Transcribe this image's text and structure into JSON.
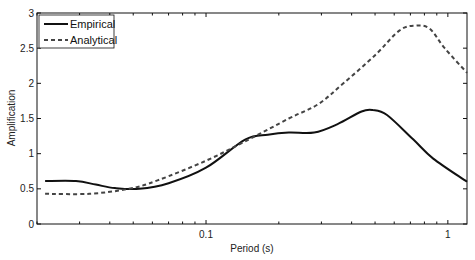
{
  "chart_data": {
    "type": "line",
    "title": "",
    "xlabel": "Period (s)",
    "ylabel": "Amplification",
    "xscale": "log",
    "xlim": [
      0.02,
      1.2
    ],
    "ylim": [
      0,
      3
    ],
    "grid": false,
    "legend_position": "upper left",
    "x_ticks": [
      {
        "value": 0.1,
        "label": "0.1"
      },
      {
        "value": 1,
        "label": "1"
      }
    ],
    "y_ticks": [
      {
        "value": 0,
        "label": "0"
      },
      {
        "value": 0.5,
        "label": "0.5"
      },
      {
        "value": 1,
        "label": "1"
      },
      {
        "value": 1.5,
        "label": "1.5"
      },
      {
        "value": 2,
        "label": "2"
      },
      {
        "value": 2.5,
        "label": "2.5"
      },
      {
        "value": 3,
        "label": "3"
      }
    ],
    "series": [
      {
        "name": "Empirical",
        "style": "solid",
        "color": "#111111",
        "x": [
          0.0216,
          0.029,
          0.035,
          0.042,
          0.053,
          0.07,
          0.1,
          0.145,
          0.18,
          0.22,
          0.28,
          0.35,
          0.44,
          0.49,
          0.56,
          0.72,
          0.87,
          1.2
        ],
        "y": [
          0.61,
          0.61,
          0.56,
          0.51,
          0.5,
          0.58,
          0.8,
          1.2,
          1.27,
          1.3,
          1.3,
          1.42,
          1.6,
          1.62,
          1.55,
          1.2,
          0.93,
          0.6
        ]
      },
      {
        "name": "Analytical",
        "style": "dashed",
        "color": "#444444",
        "x": [
          0.0216,
          0.033,
          0.048,
          0.063,
          0.1,
          0.15,
          0.22,
          0.29,
          0.37,
          0.5,
          0.63,
          0.73,
          0.84,
          0.97,
          1.2
        ],
        "y": [
          0.43,
          0.43,
          0.5,
          0.62,
          0.9,
          1.2,
          1.5,
          1.7,
          2.0,
          2.4,
          2.75,
          2.82,
          2.78,
          2.5,
          2.15
        ]
      }
    ]
  },
  "legend": {
    "items": [
      {
        "label": "Empirical"
      },
      {
        "label": "Analytical"
      }
    ]
  },
  "axes": {
    "xlabel": "Period (s)",
    "ylabel": "Amplification"
  }
}
